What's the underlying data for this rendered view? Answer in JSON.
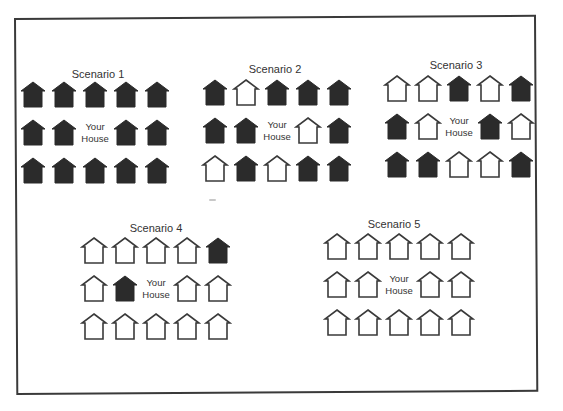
{
  "figure": {
    "colors": {
      "filled": "#2b2b2b",
      "outline": "#3a3a3a",
      "background": "#ffffff"
    },
    "center_label": "Your House",
    "scenarios": [
      {
        "title": "Scenario 1",
        "title_pos": [
          98,
          68
        ],
        "origin": [
          19,
          80
        ],
        "grid": [
          [
            "filled",
            "filled",
            "filled",
            "filled",
            "filled"
          ],
          [
            "filled",
            "filled",
            "you",
            "filled",
            "filled"
          ],
          [
            "filled",
            "filled",
            "filled",
            "filled",
            "filled"
          ]
        ]
      },
      {
        "title": "Scenario 2",
        "title_pos": [
          275,
          63
        ],
        "origin": [
          201,
          78
        ],
        "grid": [
          [
            "filled",
            "outline",
            "filled",
            "filled",
            "filled"
          ],
          [
            "filled",
            "filled",
            "you",
            "outline",
            "filled"
          ],
          [
            "outline",
            "filled",
            "outline",
            "filled",
            "filled"
          ]
        ]
      },
      {
        "title": "Scenario 3",
        "title_pos": [
          456,
          59
        ],
        "origin": [
          383,
          74
        ],
        "grid": [
          [
            "outline",
            "outline",
            "filled",
            "outline",
            "filled"
          ],
          [
            "filled",
            "outline",
            "you",
            "filled",
            "outline"
          ],
          [
            "filled",
            "filled",
            "outline",
            "outline",
            "filled"
          ]
        ]
      },
      {
        "title": "Scenario 4",
        "title_pos": [
          156,
          222
        ],
        "origin": [
          80,
          236
        ],
        "grid": [
          [
            "outline",
            "outline",
            "outline",
            "outline",
            "filled"
          ],
          [
            "outline",
            "filled",
            "you",
            "outline",
            "outline"
          ],
          [
            "outline",
            "outline",
            "outline",
            "outline",
            "outline"
          ]
        ]
      },
      {
        "title": "Scenario 5",
        "title_pos": [
          394,
          218
        ],
        "origin": [
          323,
          232
        ],
        "grid": [
          [
            "outline",
            "outline",
            "outline",
            "outline",
            "outline"
          ],
          [
            "outline",
            "outline",
            "you",
            "outline",
            "outline"
          ],
          [
            "outline",
            "outline",
            "outline",
            "outline",
            "outline"
          ]
        ]
      }
    ]
  },
  "layout": {
    "col_step": 31,
    "row_step": 38
  }
}
